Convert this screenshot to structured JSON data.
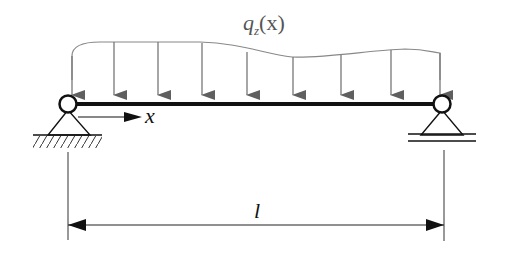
{
  "diagram": {
    "load_label": {
      "main": "q",
      "subscript": "z",
      "argument": "(x)"
    },
    "axis_label": "x",
    "span_label": "l",
    "supports": {
      "left": "pinned",
      "right": "roller"
    },
    "load_arrow_count": 9,
    "colors": {
      "beam": "#111111",
      "load": "#777777",
      "load_arrow_head": "#5f5f5f",
      "dimension": "#222222",
      "background": "#ffffff"
    }
  }
}
